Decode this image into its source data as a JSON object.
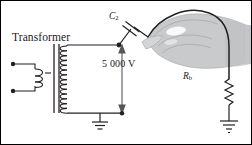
{
  "figure": {
    "background": "#ffffff",
    "border_color": "#000000",
    "width": 252,
    "height": 145
  },
  "labels": {
    "transformer": "Transformer",
    "voltage": "5 000 V",
    "capacitor_symbol": "C",
    "capacitor_subscript": "2",
    "resistor_symbol": "R",
    "resistor_subscript": "b"
  },
  "components": [
    {
      "name": "transformer-primary-coil",
      "type": "coil",
      "turns": 3,
      "side": "left"
    },
    {
      "name": "transformer-core",
      "type": "core-bars",
      "bars": 2
    },
    {
      "name": "transformer-secondary-coil",
      "type": "coil",
      "turns": 14,
      "side": "right"
    },
    {
      "name": "primary-terminal-top",
      "type": "terminal-dot"
    },
    {
      "name": "primary-terminal-bottom",
      "type": "terminal-dot"
    },
    {
      "name": "capacitor-c2",
      "type": "capacitor",
      "orientation": "diagonal"
    },
    {
      "name": "resistor-rb",
      "type": "resistor",
      "zigzag_peaks": 6
    },
    {
      "name": "ground-transformer",
      "type": "ground"
    },
    {
      "name": "ground-resistor",
      "type": "ground"
    },
    {
      "name": "hand",
      "type": "illustration",
      "description": "hand gripping the capacitor lead wire"
    },
    {
      "name": "voltage-arrow",
      "type": "double-headed-arrow",
      "direction": "vertical"
    },
    {
      "name": "hand-held-wire",
      "type": "curved-wire",
      "description": "arcs from capacitor over the hand and down to the resistor"
    }
  ],
  "colors": {
    "wire": "#231f20",
    "hand_fill": "#c9cacb",
    "hand_outline": "#9a9b9d",
    "text": "#1a1a1a",
    "voltage_arrow": "#54565a"
  }
}
